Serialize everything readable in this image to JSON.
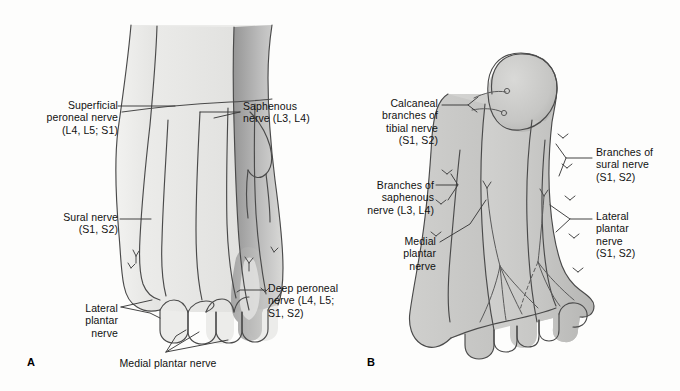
{
  "figure": {
    "background_color": "#fdfdfc",
    "ink_color": "#3a3a3a"
  },
  "panels": [
    {
      "letter": "A",
      "view": "dorsum of foot",
      "labels": [
        {
          "id": "superficial-peroneal-nerve",
          "text": "Superficial\nperoneal nerve\n(L4, L5; S1)",
          "align": "right",
          "x": 36,
          "y": 99
        },
        {
          "id": "saphenous-nerve",
          "text": "Saphenous\nnerve (L3, L4)",
          "align": "left",
          "x": 243,
          "y": 100
        },
        {
          "id": "sural-nerve",
          "text": "Sural nerve\n(S1, S2)",
          "align": "right",
          "x": 44,
          "y": 211
        },
        {
          "id": "deep-peroneal-nerve",
          "text": "Deep peroneal\nnerve (L4, L5;\nS1, S2)",
          "align": "left",
          "x": 268,
          "y": 282
        },
        {
          "id": "lateral-plantar-nerve-a",
          "text": "Lateral\nplantar\nnerve",
          "align": "right",
          "x": 63,
          "y": 302
        },
        {
          "id": "medial-plantar-nerve-a",
          "text": "Medial plantar nerve",
          "align": "center",
          "x": 109,
          "y": 357
        }
      ],
      "panel_letter_pos": {
        "x": 27,
        "y": 356
      }
    },
    {
      "letter": "B",
      "view": "sole of foot",
      "labels": [
        {
          "id": "calcaneal-branches-tibial-nerve",
          "text": "Calcaneal\nbranches of\ntibial nerve\n(S1, S2)",
          "align": "right",
          "x": 378,
          "y": 97
        },
        {
          "id": "branches-of-sural-nerve",
          "text": "Branches of\nsural nerve\n(S1, S2)",
          "align": "left",
          "x": 596,
          "y": 146
        },
        {
          "id": "branches-of-saphenous-nerve",
          "text": "Branches of\nsaphenous\nnerve (L3, L4)",
          "align": "right",
          "x": 366,
          "y": 179
        },
        {
          "id": "lateral-plantar-nerve-b",
          "text": "Lateral\nplantar\nnerve\n(S1, S2)",
          "align": "left",
          "x": 596,
          "y": 210
        },
        {
          "id": "medial-plantar-nerve-b",
          "text": "Medial\nplantar\nnerve",
          "align": "right",
          "x": 396,
          "y": 235
        }
      ],
      "panel_letter_pos": {
        "x": 367,
        "y": 356
      }
    }
  ]
}
